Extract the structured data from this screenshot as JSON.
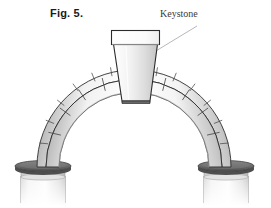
{
  "figure": {
    "caption": "Fig. 5.",
    "background_color": "#ffffff"
  },
  "annotations": [
    {
      "id": "keystone-callout",
      "label": "Keystone",
      "leader_line": true,
      "leader_from": [
        198,
        26
      ],
      "leader_to": [
        141,
        60
      ],
      "color": "#3a3a3a"
    }
  ],
  "colors": {
    "outline": "#2b2b2b",
    "joint_line": "#4a4a4a",
    "stone_light": "#fdfdfd",
    "stone_mid": "#e8e8e8",
    "stone_shadow": "#8e8e8e",
    "stone_deep_shadow": "#5a5a5a",
    "impost_dark": "#6e6e6e",
    "impost_darker": "#4f4f4f",
    "column_light": "#f6f6f6",
    "column_shade": "#cfcfcf",
    "leader_line": "#9a9a9a"
  },
  "geometry": {
    "arch_center_x": 134,
    "arch_center_y": 168,
    "inner_radius": 62,
    "outer_radius": 88,
    "archivolt_radius": 97,
    "springing_y": 168,
    "voussoir_count_per_side": 6,
    "archivolt_segment_count_per_side": 7
  },
  "parts": {
    "keystone": {
      "name": "Keystone",
      "shape": "trapezoid, wider at top",
      "cap": "rectangular abacus block on top"
    },
    "voussoir_ring": {
      "name": "Voussoirs",
      "description": "inner ring of wedge-shaped arch stones"
    },
    "archivolt_ring": {
      "name": "Archivolt",
      "description": "outer narrow ring of arch stones with offset joints"
    },
    "impost_left": {
      "name": "Left impost",
      "description": "dark elliptical capping block at springing"
    },
    "impost_right": {
      "name": "Right impost",
      "description": "dark elliptical capping block at springing"
    },
    "column_left": {
      "name": "Left pier",
      "description": "cylindrical shaft fading toward bottom"
    },
    "column_right": {
      "name": "Right pier",
      "description": "cylindrical shaft fading toward bottom"
    }
  }
}
